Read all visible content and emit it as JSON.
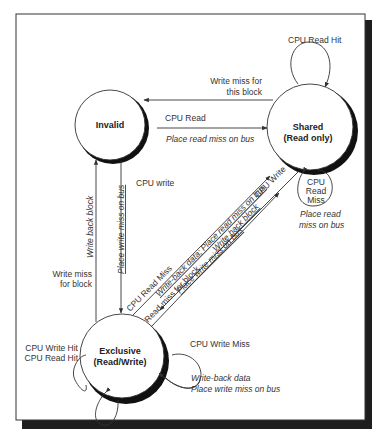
{
  "states": [
    {
      "id": "invalid",
      "label": "Invalid",
      "sublabel": ""
    },
    {
      "id": "shared",
      "label": "Shared",
      "sublabel": "(Read only)"
    },
    {
      "id": "exclusive",
      "label": "Exclusive",
      "sublabel": "(Read/Write)"
    }
  ],
  "transitions": {
    "shared_self_read_hit": {
      "event": "CPU Read Hit",
      "action": ""
    },
    "shared_to_invalid": {
      "event_line1": "Write miss for",
      "event_line2": "this block",
      "action": ""
    },
    "invalid_to_shared": {
      "event": "CPU Read",
      "action": "Place read miss on bus"
    },
    "shared_self_read_miss": {
      "event_line1": "CPU",
      "event_line2": "Read",
      "event_line3": "Miss",
      "action_line1": "Place read",
      "action_line2": "miss on bus"
    },
    "invalid_to_exclusive": {
      "event": "CPU write",
      "action": "Place write miss on bus"
    },
    "exclusive_to_invalid": {
      "event_line1": "Write miss",
      "event_line2": "for block",
      "action": "Write back block"
    },
    "exclusive_to_shared_read_miss": {
      "event": "CPU Read Miss",
      "action": "Write-back data; Place read miss on bus"
    },
    "exclusive_to_shared_bus": {
      "event": "Read miss for block",
      "action": "Write back block"
    },
    "shared_to_exclusive": {
      "event": "CPU Write",
      "action": "Place write miss on bus"
    },
    "exclusive_self_hit": {
      "event_line1": "CPU Write Hit",
      "event_line2": "CPU Read Hit"
    },
    "exclusive_self_write_miss": {
      "event": "CPU Write Miss",
      "action_line1": "Write-back data",
      "action_line2": "Place write miss on bus"
    }
  },
  "colors": {
    "background": "#ffffff",
    "frame": "#333333",
    "shadow": "#1a1a1a",
    "line": "#333333",
    "text": "#333333"
  }
}
